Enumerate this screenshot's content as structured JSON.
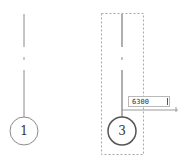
{
  "drawing": {
    "grid_lines": [
      {
        "id": "grid-1",
        "label": "1",
        "x": 24,
        "selected": false
      },
      {
        "id": "grid-3",
        "label": "3",
        "x": 122,
        "selected": true
      }
    ],
    "dimension": {
      "value": "6300"
    }
  },
  "colors": {
    "line": "#8a8a8a",
    "selection": "#9a9a9a",
    "text": "#333333"
  }
}
